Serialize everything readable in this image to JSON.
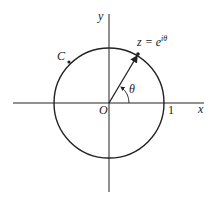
{
  "diagram": {
    "axes": {
      "x_label": "x",
      "y_label": "y"
    },
    "origin_label": "O",
    "unit_label": "1",
    "curve_label": "C",
    "point_label": "z = e",
    "point_exponent": "iθ",
    "angle_label": "θ",
    "colors": {
      "stroke": "#222222",
      "background": "#ffffff"
    }
  }
}
